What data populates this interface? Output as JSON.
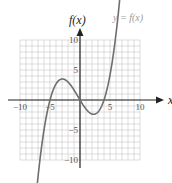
{
  "chart_data": {
    "type": "line",
    "title": "",
    "xlabel": "x",
    "ylabel": "f(x)",
    "curve_label": "y = f(x)",
    "xlim": [
      -10,
      10
    ],
    "ylim": [
      -10,
      10
    ],
    "grid": true,
    "x_ticks": [
      -10,
      -5,
      5,
      10
    ],
    "y_ticks": [
      10,
      5,
      -5,
      -10
    ],
    "x_tick_labels": [
      "−10",
      "−5",
      "5",
      "10"
    ],
    "y_tick_labels": [
      "10",
      "5",
      "−5",
      "−10"
    ],
    "series": [
      {
        "name": "y = f(x)",
        "description": "cubic with zeros near x=-5, 0, 4; local max ~(-3, 3.5); local min ~(2, -2.3)",
        "x": [
          -7.3,
          -7,
          -6,
          -5,
          -4,
          -3,
          -2,
          -1,
          0,
          1,
          2,
          3,
          4,
          5,
          6,
          6.8
        ],
        "y": [
          -11.5,
          -9.9,
          -5.0,
          0.0,
          2.7,
          3.5,
          3.0,
          1.7,
          0.0,
          -1.5,
          -2.3,
          -2.0,
          0.0,
          4.2,
          11.0,
          11.5
        ]
      }
    ],
    "colors": {
      "curve": "#6e6e6e",
      "grid": "#c8c8c8",
      "axes": "#222222"
    }
  }
}
